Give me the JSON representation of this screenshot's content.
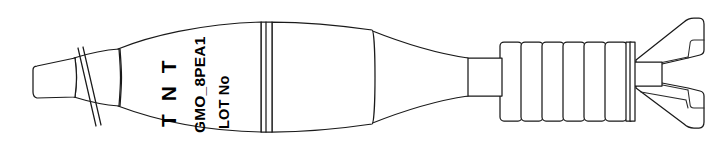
{
  "illustration": {
    "subject": "mortar-projectile-line-drawing",
    "orientation": "nose-left-tail-right",
    "stroke_color": "#1a1a1a",
    "fill_color": "#ffffff",
    "background_color": "#ffffff"
  },
  "markings": {
    "filling_label": "T N T",
    "designation_code": "GMO_8PEA1",
    "lot_label": "LOT No"
  },
  "parts": {
    "nose_tip": "nose-tip",
    "nose_cone": "ogive-nose-cone",
    "fuze_band": "diagonal-seam-band",
    "body": "main-body-shell",
    "joint_band": "body-joint-band",
    "boat_tail": "boat-tail-taper",
    "boom": "tail-boom-tube",
    "fin_ribs": "ribbed-obturator-section",
    "fin_assembly": "tail-fin-assembly"
  },
  "counts": {
    "ribs": 6,
    "thin_bands": 2,
    "fins_visible": 2
  }
}
